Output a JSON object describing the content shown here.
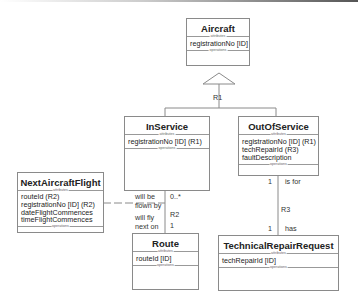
{
  "classes": {
    "aircraft": {
      "name": "Aircraft",
      "attributes_label": "attributes",
      "operations_label": "operations",
      "attributes": [
        "registrationNo [ID]"
      ]
    },
    "inservice": {
      "name": "InService",
      "attributes_label": "attributes",
      "operations_label": "operations",
      "attributes": [
        "registrationNo [ID] (R1)"
      ]
    },
    "outofservice": {
      "name": "OutOfService",
      "attributes_label": "attributes",
      "operations_label": "operations",
      "attributes": [
        "registrationNo [ID] (R1)",
        "techRepairId (R3)",
        "faultDescription"
      ]
    },
    "nextaircraftflight": {
      "name": "NextAircraftFlight",
      "attributes_label": "attributes",
      "operations_label": "operations",
      "attributes": [
        "routeId (R2)",
        "registrationNo [ID] (R2)",
        "dateFlightCommences",
        "timeFlightCommences"
      ]
    },
    "route": {
      "name": "Route",
      "attributes_label": "attributes",
      "operations_label": "operations",
      "attributes": [
        "routeId [ID]"
      ]
    },
    "technicalrepairrequest": {
      "name": "TechnicalRepairRequest",
      "attributes_label": "attributes",
      "operations_label": "operations",
      "attributes": [
        "techRepairId [ID]"
      ]
    }
  },
  "relationships": {
    "r1": {
      "label": "R1",
      "type": "generalization"
    },
    "r2": {
      "label": "R2",
      "top_phrase_1": "will be",
      "top_phrase_2": "flown by",
      "top_mult": "0..*",
      "bottom_phrase_1": "will fly",
      "bottom_phrase_2": "next on",
      "bottom_mult": "1"
    },
    "r3": {
      "label": "R3",
      "top_phrase": "is for",
      "top_mult": "1",
      "bottom_phrase": "has",
      "bottom_mult": "1"
    }
  }
}
